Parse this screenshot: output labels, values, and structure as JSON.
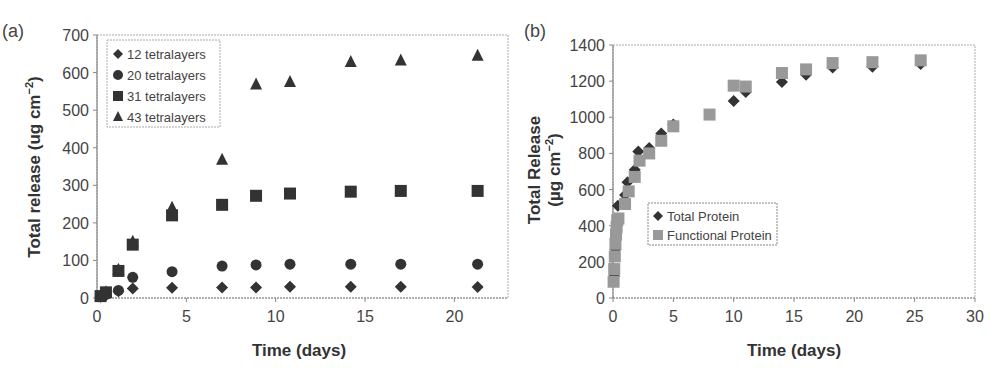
{
  "chart_data": [
    {
      "type": "scatter",
      "panel_label": "(a)",
      "title": "",
      "xlabel": "Time (days)",
      "ylabel": "Total release (ug cm⁻²)",
      "xlim": [
        0,
        23
      ],
      "ylim": [
        0,
        700
      ],
      "xticks": [
        0,
        5,
        10,
        15,
        20
      ],
      "yticks": [
        0,
        100,
        200,
        300,
        400,
        500,
        600,
        700
      ],
      "grid": false,
      "legend_position": "upper left",
      "x": [
        0.2,
        0.5,
        1.2,
        2.0,
        4.2,
        7.0,
        8.9,
        10.8,
        14.2,
        17.0,
        21.3
      ],
      "series": [
        {
          "name": "12 tetralayers",
          "marker": "diamond",
          "color": "#333333",
          "values": [
            3,
            8,
            18,
            25,
            27,
            28,
            28,
            30,
            30,
            30,
            29
          ]
        },
        {
          "name": "20 tetralayers",
          "marker": "circle",
          "color": "#333333",
          "values": [
            4,
            10,
            20,
            55,
            70,
            85,
            88,
            90,
            90,
            90,
            90
          ]
        },
        {
          "name": "31 tetralayers",
          "marker": "square",
          "color": "#333333",
          "values": [
            5,
            15,
            72,
            142,
            220,
            248,
            272,
            278,
            283,
            285,
            285
          ]
        },
        {
          "name": "43 tetralayers",
          "marker": "triangle",
          "color": "#333333",
          "values": [
            5,
            15,
            75,
            150,
            240,
            368,
            568,
            575,
            628,
            632,
            645
          ]
        }
      ]
    },
    {
      "type": "scatter",
      "panel_label": "(b)",
      "title": "",
      "xlabel": "Time (days)",
      "ylabel": "Total Release (µg cm⁻²)",
      "xlim": [
        0,
        30
      ],
      "ylim": [
        0,
        1400
      ],
      "xticks": [
        0,
        5,
        10,
        15,
        20,
        25,
        30
      ],
      "yticks": [
        0,
        200,
        400,
        600,
        800,
        1000,
        1200,
        1400
      ],
      "grid": false,
      "legend_position": "center",
      "series": [
        {
          "name": "Total Protein",
          "marker": "diamond",
          "color": "#333333",
          "x": [
            0.1,
            0.2,
            0.3,
            0.4,
            1.0,
            1.2,
            1.8,
            2.1,
            3.0,
            4.0,
            5.0,
            10.0,
            11.0,
            14.0,
            16.0,
            18.2,
            21.5,
            25.5
          ],
          "values": [
            120,
            270,
            420,
            510,
            570,
            640,
            710,
            810,
            830,
            910,
            960,
            1090,
            1140,
            1195,
            1235,
            1275,
            1280,
            1295
          ]
        },
        {
          "name": "Functional Protein",
          "marker": "square",
          "color": "#999999",
          "x": [
            0.05,
            0.1,
            0.15,
            0.2,
            0.25,
            0.3,
            0.35,
            0.45,
            1.0,
            1.3,
            1.8,
            2.2,
            3.0,
            4.0,
            5.0,
            8.0,
            10.0,
            11.0,
            14.0,
            16.0,
            18.2,
            21.5,
            25.5
          ],
          "values": [
            90,
            160,
            230,
            300,
            350,
            390,
            430,
            440,
            520,
            590,
            670,
            760,
            800,
            870,
            950,
            1015,
            1175,
            1170,
            1245,
            1265,
            1300,
            1305,
            1315
          ]
        }
      ]
    }
  ],
  "panel_a": {
    "label": "(a)",
    "xlabel": "Time (days)",
    "ylabel_main": "Total release (ug cm",
    "ylabel_sup": "−2",
    "ylabel_close": ")",
    "xticks": [
      "0",
      "5",
      "10",
      "15",
      "20"
    ],
    "yticks": [
      "0",
      "100",
      "200",
      "300",
      "400",
      "500",
      "600",
      "700"
    ],
    "legend": [
      "12 tetralayers",
      "20 tetralayers",
      "31 tetralayers",
      "43 tetralayers"
    ]
  },
  "panel_b": {
    "label": "(b)",
    "xlabel": "Time (days)",
    "ylabel_line1": "Total Release",
    "ylabel_line2_main": "(µg cm",
    "ylabel_line2_sup": "−2",
    "ylabel_line2_close": ")",
    "xticks": [
      "0",
      "5",
      "10",
      "15",
      "20",
      "25",
      "30"
    ],
    "yticks": [
      "0",
      "200",
      "400",
      "600",
      "800",
      "1000",
      "1200",
      "1400"
    ],
    "legend": [
      "Total Protein",
      "Functional Protein"
    ]
  },
  "colors": {
    "dark_marker": "#333333",
    "light_marker": "#999999",
    "axis": "#888888",
    "text": "#444444"
  }
}
